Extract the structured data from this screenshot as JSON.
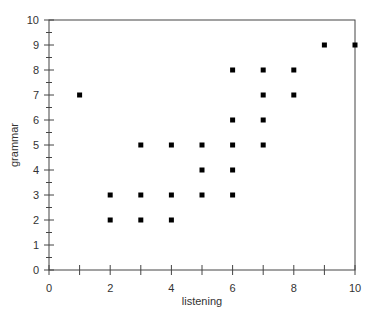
{
  "chart_data": {
    "type": "scatter",
    "title": "",
    "xlabel": "listening",
    "ylabel": "grammar",
    "xlim": [
      0,
      10
    ],
    "ylim": [
      0,
      10
    ],
    "grid": false,
    "legend": null,
    "x_ticks_major": [
      0,
      2,
      4,
      6,
      8,
      10
    ],
    "x_ticks_minor": [
      1,
      3,
      5,
      7,
      9
    ],
    "x_tick_labels": [
      "0",
      "2",
      "4",
      "6",
      "8",
      "10"
    ],
    "y_ticks_major": [
      0,
      1,
      2,
      3,
      4,
      5,
      6,
      7,
      8,
      9,
      10
    ],
    "y_tick_labels": [
      "0",
      "1",
      "2",
      "3",
      "4",
      "5",
      "6",
      "7",
      "8",
      "9",
      "10"
    ],
    "marker": "square",
    "marker_color": "#000000",
    "series": [
      {
        "name": "listening vs grammar",
        "points": [
          [
            1,
            7
          ],
          [
            2,
            3
          ],
          [
            2,
            2
          ],
          [
            3,
            5
          ],
          [
            3,
            3
          ],
          [
            3,
            2
          ],
          [
            4,
            5
          ],
          [
            4,
            3
          ],
          [
            4,
            2
          ],
          [
            5,
            5
          ],
          [
            5,
            4
          ],
          [
            5,
            3
          ],
          [
            6,
            8
          ],
          [
            6,
            6
          ],
          [
            6,
            5
          ],
          [
            6,
            4
          ],
          [
            6,
            3
          ],
          [
            7,
            8
          ],
          [
            7,
            7
          ],
          [
            7,
            6
          ],
          [
            7,
            5
          ],
          [
            8,
            8
          ],
          [
            8,
            7
          ],
          [
            9,
            9
          ],
          [
            10,
            9
          ]
        ]
      }
    ]
  },
  "layout": {
    "plot_left": 49,
    "plot_right": 355,
    "plot_top": 20,
    "plot_bottom": 270,
    "axis_color": "#444444"
  }
}
